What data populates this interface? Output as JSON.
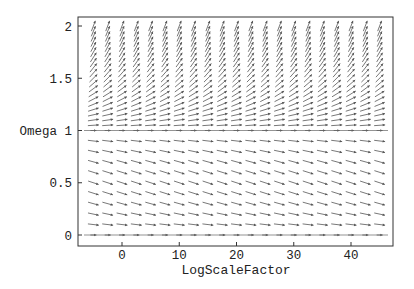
{
  "chart_data": {
    "type": "vector_field",
    "title": "",
    "xlabel": "LogScaleFactor",
    "ylabel": "Omega",
    "xlim": [
      -6.5,
      46.5
    ],
    "ylim": [
      -0.12,
      2.08
    ],
    "x_ticks": [
      0,
      10,
      20,
      30,
      40
    ],
    "x_tick_labels": [
      "0",
      "10",
      "20",
      "30",
      "40"
    ],
    "y_ticks": [
      0,
      0.5,
      1,
      1.5,
      2
    ],
    "y_tick_labels": [
      "0",
      "0.5",
      "Omega 1",
      "1.5",
      "2"
    ],
    "grid": false,
    "legend": null,
    "field": {
      "description": "Phase flow of density parameter Omega vs log scale factor; Omega=1 unstable fixed line, Omega=0 attractor, Omega grows beyond 1 diverging upward",
      "equation": "dOmega/dx = Omega*(Omega-1)",
      "x_samples": [
        -5,
        -2.5,
        0,
        2.5,
        5,
        7.5,
        10,
        12.5,
        15,
        17.5,
        20,
        22.5,
        25,
        27.5,
        30,
        32.5,
        35,
        37.5,
        40,
        42.5,
        45
      ],
      "omega_samples_upper": [
        1.05,
        1.1,
        1.15,
        1.2,
        1.25,
        1.3,
        1.35,
        1.4,
        1.45,
        1.5,
        1.55,
        1.6,
        1.65,
        1.7,
        1.75,
        1.8,
        1.85,
        1.9,
        1.95,
        2.0
      ],
      "omega_samples_lower": [
        0.0,
        0.1,
        0.2,
        0.3,
        0.4,
        0.5,
        0.6,
        0.7,
        0.8,
        0.9,
        1.0
      ],
      "arrow_color": "#555555"
    }
  },
  "frame": {
    "left": 78,
    "top": 17,
    "right": 393,
    "bottom": 246
  },
  "labels": {
    "xlabel": "LogScaleFactor",
    "ylabel": "Omega"
  }
}
